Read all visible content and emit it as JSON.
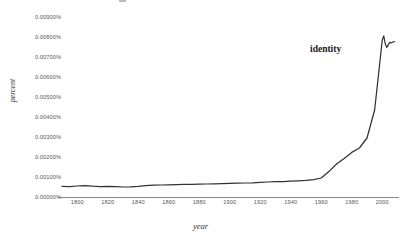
{
  "chart_data": {
    "type": "line",
    "title": "",
    "xlabel": "year",
    "ylabel": "percent",
    "grid": false,
    "legend_position": "inline-annotation",
    "xlim": [
      1790,
      2009
    ],
    "ylim": [
      0.0,
      0.009
    ],
    "x_tick_labels": [
      "1800",
      "1820",
      "1840",
      "1860",
      "1880",
      "1900",
      "1920",
      "1940",
      "1960",
      "1980",
      "2000"
    ],
    "x_ticks": [
      1800,
      1820,
      1840,
      1860,
      1880,
      1900,
      1920,
      1940,
      1960,
      1980,
      2000
    ],
    "y_tick_labels": [
      "0.00900%",
      "0.00800%",
      "0.00700%",
      "0.00600%",
      "0.00500%",
      "0.00400%",
      "0.00300%",
      "0.00200%",
      "0.00100%",
      "0.00000%"
    ],
    "y_ticks": [
      0.009,
      0.008,
      0.007,
      0.006,
      0.005,
      0.004,
      0.003,
      0.002,
      0.001,
      0.0
    ],
    "unit": "percent",
    "line_color": "#333333",
    "axis_color": "#888888",
    "background_color": "#ffffff",
    "series": [
      {
        "name": "identity",
        "annotation": "identity",
        "color": "#333333",
        "x": [
          1790,
          1795,
          1800,
          1805,
          1810,
          1815,
          1820,
          1825,
          1830,
          1835,
          1840,
          1845,
          1850,
          1855,
          1860,
          1865,
          1870,
          1875,
          1880,
          1885,
          1890,
          1895,
          1900,
          1905,
          1910,
          1915,
          1920,
          1925,
          1930,
          1935,
          1940,
          1945,
          1950,
          1955,
          1960,
          1965,
          1970,
          1975,
          1980,
          1985,
          1990,
          1995,
          2000,
          2001,
          2002,
          2003,
          2004,
          2005,
          2006,
          2007,
          2008
        ],
        "values": [
          0.00058,
          0.00057,
          0.0006,
          0.00062,
          0.00059,
          0.00057,
          0.00058,
          0.00057,
          0.00055,
          0.00056,
          0.00058,
          0.00062,
          0.00064,
          0.00065,
          0.00066,
          0.00067,
          0.00068,
          0.00068,
          0.00069,
          0.0007,
          0.00071,
          0.00072,
          0.00073,
          0.00074,
          0.00075,
          0.00076,
          0.00078,
          0.0008,
          0.00082,
          0.00082,
          0.00084,
          0.00086,
          0.00088,
          0.00092,
          0.001,
          0.00132,
          0.0017,
          0.00198,
          0.00228,
          0.0025,
          0.003,
          0.0044,
          0.0079,
          0.0081,
          0.0077,
          0.00752,
          0.00768,
          0.00778,
          0.00776,
          0.0078,
          0.00782
        ]
      }
    ]
  },
  "annotations": {
    "series_label": "identity"
  },
  "axis_titles": {
    "x": "year",
    "y": "percent"
  }
}
